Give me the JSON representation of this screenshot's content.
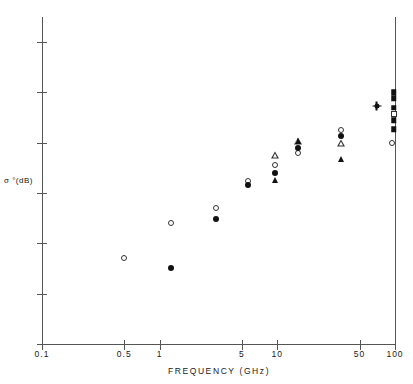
{
  "chart_data": {
    "type": "scatter",
    "title": "",
    "xlabel": "FREQUENCY  (GHz)",
    "ylabel": "σ °(dB)",
    "xscale": "log",
    "xlim": [
      0.1,
      100
    ],
    "ylim": [
      -80,
      -15
    ],
    "grid": false,
    "legend": "none",
    "xticks": [
      {
        "value": 0.1,
        "label": "0.1"
      },
      {
        "value": 0.5,
        "label": "0.5"
      },
      {
        "value": 1,
        "label": "1"
      },
      {
        "value": 5,
        "label": "5"
      },
      {
        "value": 10,
        "label": "10"
      },
      {
        "value": 50,
        "label": "50"
      },
      {
        "value": 100,
        "label": "100"
      }
    ],
    "yticks": [
      {
        "value": -20,
        "label": "-20"
      },
      {
        "value": -30,
        "label": "-30"
      },
      {
        "value": -40,
        "label": "-40"
      },
      {
        "value": -50,
        "label": "-50"
      },
      {
        "value": -60,
        "label": "-60"
      },
      {
        "value": -70,
        "label": "-70"
      },
      {
        "value": -80,
        "label": "-80"
      }
    ],
    "series": [
      {
        "name": "open-circle",
        "marker": "open-circle",
        "points": [
          {
            "x": 0.5,
            "y": -63.0
          },
          {
            "x": 1.25,
            "y": -56.0
          },
          {
            "x": 3.0,
            "y": -53.0
          },
          {
            "x": 5.6,
            "y": -47.5
          },
          {
            "x": 9.6,
            "y": -44.5
          },
          {
            "x": 15.0,
            "y": -42.0
          },
          {
            "x": 35.0,
            "y": -37.5
          },
          {
            "x": 95.0,
            "y": -40.0
          }
        ]
      },
      {
        "name": "filled-circle",
        "marker": "filled-circle",
        "points": [
          {
            "x": 1.25,
            "y": -64.8
          },
          {
            "x": 3.0,
            "y": -55.2
          },
          {
            "x": 5.6,
            "y": -48.3
          },
          {
            "x": 9.6,
            "y": -46.0
          },
          {
            "x": 15.0,
            "y": -41.0
          },
          {
            "x": 35.0,
            "y": -38.7
          }
        ]
      },
      {
        "name": "open-triangle",
        "marker": "open-triangle",
        "points": [
          {
            "x": 9.6,
            "y": -42.5
          },
          {
            "x": 15.0,
            "y": -38.2
          },
          {
            "x": 35.0,
            "y": -37.2
          }
        ]
      },
      {
        "name": "filled-triangle",
        "marker": "filled-triangle",
        "points": [
          {
            "x": 9.6,
            "y": -47.4
          },
          {
            "x": 15.0,
            "y": -39.6
          },
          {
            "x": 35.0,
            "y": -43.3
          }
        ]
      },
      {
        "name": "filled-square",
        "marker": "filled-square",
        "points": [
          {
            "x": 98.0,
            "y": -30.0
          },
          {
            "x": 98.0,
            "y": -31.2
          },
          {
            "x": 98.0,
            "y": -33.0
          },
          {
            "x": 98.0,
            "y": -35.5
          },
          {
            "x": 98.0,
            "y": -37.3
          }
        ]
      },
      {
        "name": "open-square",
        "marker": "open-square",
        "points": [
          {
            "x": 98.0,
            "y": -34.3
          }
        ]
      },
      {
        "name": "star",
        "marker": "star",
        "points": [
          {
            "x": 70.0,
            "y": -32.7
          }
        ]
      }
    ]
  }
}
